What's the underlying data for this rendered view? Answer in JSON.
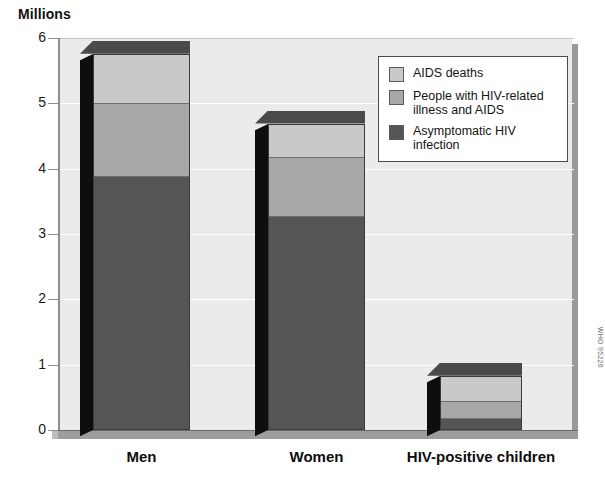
{
  "chart_data": {
    "type": "bar",
    "title": "",
    "subtitle": "",
    "ylabel": "Millions",
    "xlabel": "",
    "ylim": [
      0,
      6
    ],
    "yticks": [
      0,
      1,
      2,
      3,
      4,
      5,
      6
    ],
    "ytick_labels": [
      "0",
      "1",
      "2",
      "3",
      "4",
      "5",
      "6"
    ],
    "grid": true,
    "stacked": true,
    "legend_position": "top-right",
    "categories": [
      "Men",
      "Women",
      "HIV-positive children"
    ],
    "series": [
      {
        "name": "Asymptomatic HIV infection",
        "color": "#555555",
        "values": [
          3.88,
          3.28,
          0.19
        ]
      },
      {
        "name": "People with HIV-related illness and AIDS",
        "color": "#a8a8a8",
        "values": [
          1.12,
          0.9,
          0.26
        ]
      },
      {
        "name": "AIDS deaths",
        "color": "#c9c9c9",
        "values": [
          0.76,
          0.51,
          0.38
        ]
      }
    ],
    "totals": [
      5.76,
      4.69,
      0.83
    ],
    "annotations": [
      "WHO 95226"
    ]
  },
  "axis": {
    "y_title": "Millions",
    "tick_labels": [
      "6",
      "5",
      "4",
      "3",
      "2",
      "1",
      "0"
    ]
  },
  "legend": {
    "items": [
      {
        "label": "AIDS deaths",
        "swatch": "light-gray-swatch"
      },
      {
        "label": "People with HIV-related\nillness and AIDS",
        "swatch": "medium-gray-swatch"
      },
      {
        "label": "Asymptomatic HIV infection",
        "swatch": "dark-gray-swatch"
      }
    ]
  },
  "categories": [
    {
      "label": "Men"
    },
    {
      "label": "Women"
    },
    {
      "label": "HIV-positive children"
    }
  ],
  "credit": {
    "text": "WHO 95226"
  },
  "colors": {
    "aids_deaths": "#c9c9c9",
    "hiv_illness": "#a8a8a8",
    "asymptomatic": "#555555",
    "plot_background": "#ebebeb",
    "gridline": "#ffffff",
    "frame": "#9a9a9a"
  }
}
